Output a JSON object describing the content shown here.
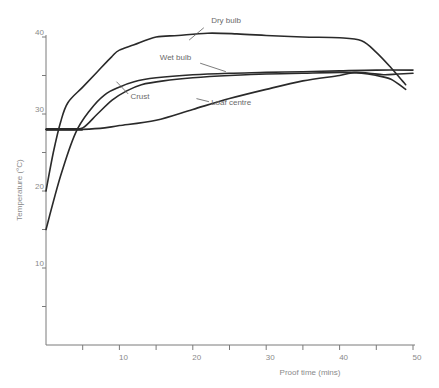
{
  "chart_data": {
    "type": "line",
    "title": "",
    "xlabel": "Proof time (mins)",
    "ylabel": "Temperature (°C)",
    "xlim": [
      0,
      50
    ],
    "ylim": [
      0,
      40
    ],
    "x_ticks": [
      0,
      5,
      10,
      15,
      20,
      25,
      30,
      35,
      40,
      45,
      50
    ],
    "x_tick_labels": [
      "",
      "",
      "10",
      "",
      "20",
      "",
      "30",
      "",
      "40",
      "",
      "50"
    ],
    "y_ticks": [
      0,
      5,
      10,
      15,
      20,
      25,
      30,
      35,
      40
    ],
    "y_tick_labels": [
      "",
      "",
      "10",
      "",
      "20",
      "",
      "30",
      "",
      "40"
    ],
    "grid": false,
    "legend": "inline labels",
    "series": [
      {
        "name": "Dry bulb",
        "x": [
          0,
          1,
          2,
          3,
          5,
          7,
          9,
          10,
          12,
          15,
          18,
          22,
          26,
          30,
          35,
          40,
          43,
          45,
          47,
          49
        ],
        "y": [
          20,
          25,
          29,
          31.5,
          33.5,
          35.5,
          37.5,
          38.3,
          39,
          40,
          40.2,
          40.5,
          40.4,
          40.2,
          40,
          39.9,
          39.5,
          38,
          36,
          33.8
        ]
      },
      {
        "name": "Wet bulb",
        "x": [
          0,
          2,
          4,
          6,
          8,
          10,
          12,
          15,
          20,
          25,
          30,
          35,
          40,
          45,
          50
        ],
        "y": [
          15,
          22,
          27.5,
          30.5,
          32.5,
          33.5,
          34.2,
          34.7,
          35.1,
          35.3,
          35.4,
          35.5,
          35.6,
          35.7,
          35.7
        ]
      },
      {
        "name": "Crust",
        "x": [
          0,
          1,
          3,
          5,
          7,
          9,
          11,
          13,
          16,
          20,
          25,
          30,
          35,
          40,
          43,
          45,
          47,
          49
        ],
        "y": [
          28,
          28,
          28,
          28.2,
          30,
          31.8,
          33,
          33.8,
          34.3,
          34.7,
          35,
          35.2,
          35.3,
          35.4,
          35.3,
          35,
          34.5,
          33.2
        ]
      },
      {
        "name": "Loaf centre",
        "x": [
          0,
          3,
          5,
          8,
          10,
          15,
          20,
          25,
          30,
          35,
          40,
          42,
          44,
          46,
          48,
          50
        ],
        "y": [
          28,
          28,
          28,
          28.2,
          28.5,
          29.2,
          30.6,
          32,
          33.2,
          34.3,
          35,
          35.4,
          35.3,
          35.1,
          35.2,
          35.3
        ]
      }
    ],
    "annotations": [
      {
        "text": "Dry bulb",
        "x": 22.5,
        "y": 41.8
      },
      {
        "text": "Wet bulb",
        "x": 15.5,
        "y": 37
      },
      {
        "text": "Crust",
        "x": 11.5,
        "y": 32
      },
      {
        "text": "Loaf centre",
        "x": 22.5,
        "y": 31.2
      }
    ]
  }
}
